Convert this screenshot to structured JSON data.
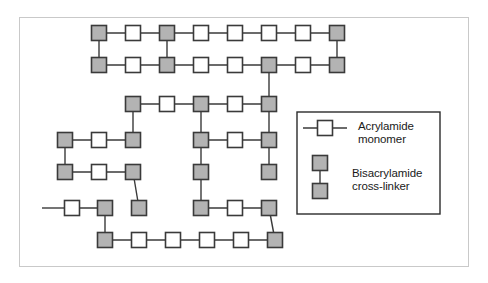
{
  "figure": {
    "frame": {
      "x": 19,
      "y": 17,
      "width": 450,
      "height": 250,
      "border_color": "#c9c9c9"
    },
    "background_color": "#ffffff"
  },
  "style": {
    "monomer_fill": "#ffffff",
    "crosslinker_fill": "#b3b3b3",
    "node_stroke": "#3a3a3a",
    "bond_stroke": "#3a3a3a",
    "node_size": 15,
    "node_stroke_width": 1.6,
    "bond_stroke_width": 1.4,
    "text_color": "#1a1a1a"
  },
  "legend": {
    "box": {
      "x": 297,
      "y": 112,
      "width": 143,
      "height": 102,
      "border_color": "#2b2b2b"
    },
    "entries": [
      {
        "id": "acrylamide",
        "label_line1": "Acrylamide",
        "label_line2": "monomer",
        "symbol": "white-square-with-bonds",
        "fill": "#ffffff"
      },
      {
        "id": "bisacrylamide",
        "label_line1": "Bisacrylamide",
        "label_line2": "cross-linker",
        "symbol": "two-gray-squares-linked",
        "fill": "#b3b3b3"
      }
    ]
  },
  "network": {
    "description": "Cross-linked polyacrylamide lattice of acrylamide monomers (white squares) joined by bisacrylamide cross-linkers (gray squares).",
    "node_counts": {
      "monomer": 24,
      "crosslinker": 25,
      "total": 49
    },
    "nodes": [
      {
        "id": "n1",
        "x": 99,
        "y": 33,
        "type": "crosslinker"
      },
      {
        "id": "n2",
        "x": 133,
        "y": 33,
        "type": "monomer"
      },
      {
        "id": "n3",
        "x": 167,
        "y": 33,
        "type": "crosslinker"
      },
      {
        "id": "n4",
        "x": 201,
        "y": 33,
        "type": "monomer"
      },
      {
        "id": "n5",
        "x": 235,
        "y": 33,
        "type": "monomer"
      },
      {
        "id": "n6",
        "x": 269,
        "y": 33,
        "type": "monomer"
      },
      {
        "id": "n7",
        "x": 303,
        "y": 33,
        "type": "monomer"
      },
      {
        "id": "n8",
        "x": 337,
        "y": 33,
        "type": "crosslinker"
      },
      {
        "id": "n9",
        "x": 99,
        "y": 65,
        "type": "crosslinker"
      },
      {
        "id": "n10",
        "x": 133,
        "y": 65,
        "type": "monomer"
      },
      {
        "id": "n11",
        "x": 167,
        "y": 65,
        "type": "crosslinker"
      },
      {
        "id": "n12",
        "x": 201,
        "y": 65,
        "type": "monomer"
      },
      {
        "id": "n13",
        "x": 235,
        "y": 65,
        "type": "monomer"
      },
      {
        "id": "n14",
        "x": 269,
        "y": 65,
        "type": "crosslinker"
      },
      {
        "id": "n15",
        "x": 303,
        "y": 65,
        "type": "monomer"
      },
      {
        "id": "n16",
        "x": 337,
        "y": 65,
        "type": "crosslinker"
      },
      {
        "id": "n17",
        "x": 133,
        "y": 104,
        "type": "crosslinker"
      },
      {
        "id": "n18",
        "x": 167,
        "y": 104,
        "type": "monomer"
      },
      {
        "id": "n19",
        "x": 201,
        "y": 104,
        "type": "crosslinker"
      },
      {
        "id": "n20",
        "x": 235,
        "y": 104,
        "type": "monomer"
      },
      {
        "id": "n21",
        "x": 269,
        "y": 104,
        "type": "crosslinker"
      },
      {
        "id": "n22",
        "x": 65,
        "y": 140,
        "type": "crosslinker"
      },
      {
        "id": "n23",
        "x": 99,
        "y": 140,
        "type": "monomer"
      },
      {
        "id": "n24",
        "x": 133,
        "y": 140,
        "type": "crosslinker"
      },
      {
        "id": "n25",
        "x": 201,
        "y": 140,
        "type": "crosslinker"
      },
      {
        "id": "n26",
        "x": 235,
        "y": 140,
        "type": "monomer"
      },
      {
        "id": "n27",
        "x": 269,
        "y": 140,
        "type": "crosslinker"
      },
      {
        "id": "n28",
        "x": 65,
        "y": 172,
        "type": "crosslinker"
      },
      {
        "id": "n29",
        "x": 99,
        "y": 172,
        "type": "monomer"
      },
      {
        "id": "n30",
        "x": 133,
        "y": 172,
        "type": "crosslinker"
      },
      {
        "id": "n31",
        "x": 201,
        "y": 172,
        "type": "crosslinker"
      },
      {
        "id": "n32",
        "x": 269,
        "y": 172,
        "type": "crosslinker"
      },
      {
        "id": "n33",
        "x": 72,
        "y": 208,
        "type": "monomer"
      },
      {
        "id": "n34",
        "x": 105,
        "y": 208,
        "type": "crosslinker"
      },
      {
        "id": "n35",
        "x": 139,
        "y": 208,
        "type": "crosslinker"
      },
      {
        "id": "n36",
        "x": 201,
        "y": 208,
        "type": "crosslinker"
      },
      {
        "id": "n37",
        "x": 235,
        "y": 208,
        "type": "monomer"
      },
      {
        "id": "n38",
        "x": 269,
        "y": 208,
        "type": "crosslinker"
      },
      {
        "id": "n39",
        "x": 105,
        "y": 240,
        "type": "crosslinker"
      },
      {
        "id": "n40",
        "x": 139,
        "y": 240,
        "type": "monomer"
      },
      {
        "id": "n41",
        "x": 173,
        "y": 240,
        "type": "monomer"
      },
      {
        "id": "n42",
        "x": 207,
        "y": 240,
        "type": "monomer"
      },
      {
        "id": "n43",
        "x": 241,
        "y": 240,
        "type": "monomer"
      },
      {
        "id": "n44",
        "x": 275,
        "y": 240,
        "type": "crosslinker"
      }
    ],
    "bonds": [
      [
        "n1",
        "n2"
      ],
      [
        "n2",
        "n3"
      ],
      [
        "n3",
        "n4"
      ],
      [
        "n4",
        "n5"
      ],
      [
        "n5",
        "n6"
      ],
      [
        "n6",
        "n7"
      ],
      [
        "n7",
        "n8"
      ],
      [
        "n9",
        "n10"
      ],
      [
        "n10",
        "n11"
      ],
      [
        "n11",
        "n12"
      ],
      [
        "n12",
        "n13"
      ],
      [
        "n13",
        "n14"
      ],
      [
        "n14",
        "n15"
      ],
      [
        "n15",
        "n16"
      ],
      [
        "n1",
        "n9"
      ],
      [
        "n3",
        "n11"
      ],
      [
        "n8",
        "n16"
      ],
      [
        "n17",
        "n18"
      ],
      [
        "n18",
        "n19"
      ],
      [
        "n19",
        "n20"
      ],
      [
        "n20",
        "n21"
      ],
      [
        "n14",
        "n21"
      ],
      [
        "n17",
        "n24"
      ],
      [
        "n19",
        "n25"
      ],
      [
        "n21",
        "n27"
      ],
      [
        "n22",
        "n23"
      ],
      [
        "n23",
        "n24"
      ],
      [
        "n25",
        "n26"
      ],
      [
        "n26",
        "n27"
      ],
      [
        "n22",
        "n28"
      ],
      [
        "n27",
        "n32"
      ],
      [
        "n28",
        "n29"
      ],
      [
        "n29",
        "n30"
      ],
      [
        "n30",
        "n35"
      ],
      [
        "n31",
        "n36"
      ],
      [
        "n33",
        "n34"
      ],
      [
        "n34",
        "n39"
      ],
      [
        "n36",
        "n37"
      ],
      [
        "n37",
        "n38"
      ],
      [
        "n38",
        "n44"
      ],
      [
        "n39",
        "n40"
      ],
      [
        "n40",
        "n41"
      ],
      [
        "n41",
        "n42"
      ],
      [
        "n42",
        "n43"
      ],
      [
        "n43",
        "n44"
      ],
      [
        "n25",
        "n31"
      ]
    ],
    "dangling_bonds": [
      {
        "id": "free-end-left",
        "x1": 42,
        "y1": 208,
        "x2": 64,
        "y2": 208
      }
    ]
  }
}
